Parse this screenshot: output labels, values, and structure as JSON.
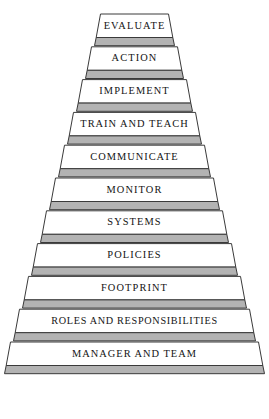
{
  "figure": {
    "background_color": "#ffffff",
    "face_color": "#ffffff",
    "riser_color": "#b3b3b3",
    "outline_color": "#3a3a3a",
    "text_color": "#141414"
  },
  "geometry": {
    "canvas_width": 269,
    "canvas_height": 419,
    "top_y": 14,
    "bottom_y": 408,
    "tier_pitch": 32.8,
    "face_height": 23.5,
    "riser_height": 8.2,
    "apex_center_x": 134.5,
    "top_face_half_width": 34,
    "bottom_face_half_width": 124,
    "side_slant": 6
  },
  "pyramid": {
    "tiers": [
      {
        "index": 1,
        "label": "EVALUATE",
        "letter_spacing": 1.1,
        "font_size": 10.4
      },
      {
        "index": 2,
        "label": "ACTION",
        "letter_spacing": 1.1,
        "font_size": 10.4
      },
      {
        "index": 3,
        "label": "IMPLEMENT",
        "letter_spacing": 1.1,
        "font_size": 10.4
      },
      {
        "index": 4,
        "label": "TRAIN AND TEACH",
        "letter_spacing": 1.0,
        "font_size": 10.4
      },
      {
        "index": 5,
        "label": "COMMUNICATE",
        "letter_spacing": 1.0,
        "font_size": 10.4
      },
      {
        "index": 6,
        "label": "MONITOR",
        "letter_spacing": 1.1,
        "font_size": 10.4
      },
      {
        "index": 7,
        "label": "SYSTEMS",
        "letter_spacing": 1.1,
        "font_size": 10.4
      },
      {
        "index": 8,
        "label": "POLICIES",
        "letter_spacing": 1.1,
        "font_size": 10.4
      },
      {
        "index": 9,
        "label": "FOOTPRINT",
        "letter_spacing": 1.1,
        "font_size": 10.4
      },
      {
        "index": 10,
        "label": "ROLES AND RESPONSIBILITIES",
        "letter_spacing": 0.7,
        "font_size": 10.2
      },
      {
        "index": 11,
        "label": "MANAGER AND TEAM",
        "letter_spacing": 1.0,
        "font_size": 10.4
      }
    ]
  }
}
